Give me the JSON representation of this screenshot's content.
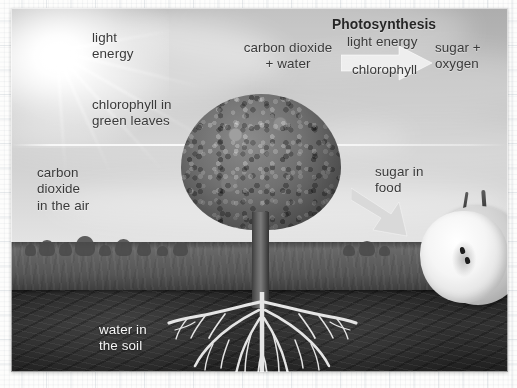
{
  "diagram": {
    "title": "Photosynthesis",
    "equation": {
      "reactants": "carbon dioxide\n+ water",
      "above_arrow": "light energy",
      "below_arrow": "chlorophyll",
      "products": "sugar +\noxygen",
      "arrow_icon": "right-arrow-icon"
    },
    "labels": [
      {
        "id": "light-energy",
        "text": "light\nenergy"
      },
      {
        "id": "chlorophyll-leaves",
        "text": "chlorophyll in\ngreen leaves"
      },
      {
        "id": "carbon-dioxide-air",
        "text": "carbon\ndioxide\nin the air"
      },
      {
        "id": "water-soil",
        "text": "water in\nthe soil"
      },
      {
        "id": "sugar-in-food",
        "text": "sugar in\nfood"
      }
    ],
    "scene": {
      "tree_alt": "broadleaf tree with visible root system",
      "apple_alt": "apple cut in half showing seeds",
      "layers": [
        "sky",
        "field",
        "soil"
      ]
    },
    "colors": {
      "sky": "#bfc3c3",
      "field": "#62654c",
      "soil": "#2d2e24",
      "canopy": "#6f7260",
      "label_text": "#3a3c3c",
      "light_label_text": "#f3f3f0",
      "arrow": "#e6e6e1"
    }
  }
}
